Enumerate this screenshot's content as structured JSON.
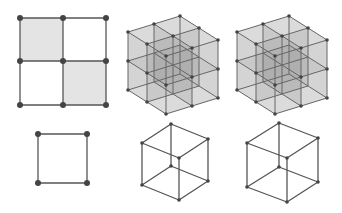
{
  "figure": {
    "colors": {
      "edge": "#555555",
      "node": "#444444",
      "shaded_cell": "#e4e4e4",
      "cube_fill": "#6e6e6e",
      "background": "#ffffff"
    },
    "panels": [
      {
        "id": "grid-2x2",
        "type": "2d-grid",
        "xs": [
          20,
          63,
          106
        ],
        "ys": [
          18,
          61,
          105
        ],
        "shaded_cells": [
          [
            0,
            0
          ],
          [
            1,
            1
          ]
        ]
      },
      {
        "id": "cube-2x2x2-a",
        "type": "3d-lattice",
        "origin": [
          166,
          114
        ],
        "vec_left": [
          -19,
          -12
        ],
        "vec_right": [
          26,
          -8
        ],
        "vec_up": [
          0,
          -29
        ],
        "size": 2
      },
      {
        "id": "cube-2x2x2-b",
        "type": "3d-lattice",
        "origin": [
          275,
          114
        ],
        "vec_left": [
          -19,
          -12
        ],
        "vec_right": [
          26,
          -8
        ],
        "vec_up": [
          0,
          -29
        ],
        "size": 2
      },
      {
        "id": "unit-square",
        "type": "square",
        "corners": [
          [
            38,
            134
          ],
          [
            87,
            134
          ],
          [
            87,
            183
          ],
          [
            38,
            183
          ]
        ]
      },
      {
        "id": "unit-cube-a",
        "type": "wire-cube",
        "vertices": {
          "back_top": [
            171,
            124
          ],
          "left_top": [
            142,
            143
          ],
          "right_top": [
            208,
            139
          ],
          "front_top": [
            179,
            158
          ],
          "back_bottom": [
            171,
            166
          ],
          "left_bottom": [
            142,
            185
          ],
          "right_bottom": [
            208,
            181
          ],
          "front_bottom": [
            179,
            200
          ]
        }
      },
      {
        "id": "unit-cube-b",
        "type": "wire-cube",
        "vertices": {
          "back_top": [
            279,
            123
          ],
          "left_top": [
            247,
            143
          ],
          "right_top": [
            318,
            138
          ],
          "front_top": [
            287,
            158
          ],
          "back_bottom": [
            279,
            167
          ],
          "left_bottom": [
            247,
            187
          ],
          "right_bottom": [
            318,
            182
          ],
          "front_bottom": [
            287,
            202
          ]
        }
      }
    ]
  }
}
